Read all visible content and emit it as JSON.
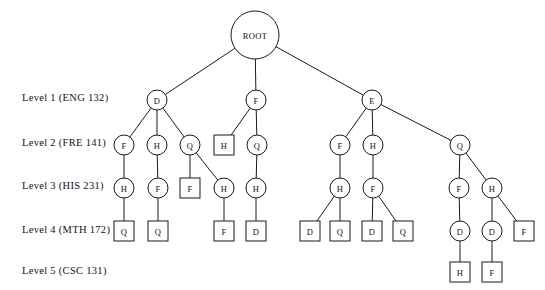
{
  "diagram": {
    "width": 545,
    "height": 290,
    "background": "#ffffff",
    "stroke_color": "#1a1a1a",
    "text_color": "#111111"
  },
  "level_labels": [
    {
      "id": "level-1",
      "text": "Level 1 (ENG 132)",
      "x": 22,
      "y": 92
    },
    {
      "id": "level-2",
      "text": "Level 2 (FRE 141)",
      "x": 22,
      "y": 137
    },
    {
      "id": "level-3",
      "text": "Level 3 (HIS 231)",
      "x": 22,
      "y": 180
    },
    {
      "id": "level-4",
      "text": "Level 4 (MTH 172)",
      "x": 22,
      "y": 224
    },
    {
      "id": "level-5",
      "text": "Level 5 (CSC 131)",
      "x": 22,
      "y": 265
    }
  ],
  "nodes": [
    {
      "id": "root",
      "label": "ROOT",
      "shape": "circle",
      "x": 255,
      "y": 35,
      "r": 24,
      "level": 0
    },
    {
      "id": "n_d1",
      "label": "D",
      "shape": "circle",
      "x": 157,
      "y": 100,
      "r": 10,
      "level": 1
    },
    {
      "id": "n_f1",
      "label": "F",
      "shape": "circle",
      "x": 256,
      "y": 100,
      "r": 10,
      "level": 1
    },
    {
      "id": "n_e1",
      "label": "E",
      "shape": "circle",
      "x": 372,
      "y": 100,
      "r": 10,
      "level": 1
    },
    {
      "id": "n_f2a",
      "label": "F",
      "shape": "circle",
      "x": 124,
      "y": 145,
      "r": 10,
      "level": 2
    },
    {
      "id": "n_h2a",
      "label": "H",
      "shape": "circle",
      "x": 157,
      "y": 145,
      "r": 10,
      "level": 2
    },
    {
      "id": "n_q2a",
      "label": "Q",
      "shape": "circle",
      "x": 190,
      "y": 145,
      "r": 10,
      "level": 2
    },
    {
      "id": "n_h2b",
      "label": "H",
      "shape": "square",
      "x": 224,
      "y": 145,
      "r": 10,
      "level": 2
    },
    {
      "id": "n_q2b",
      "label": "Q",
      "shape": "circle",
      "x": 257,
      "y": 145,
      "r": 10,
      "level": 2
    },
    {
      "id": "n_f2c",
      "label": "F",
      "shape": "circle",
      "x": 340,
      "y": 145,
      "r": 10,
      "level": 2
    },
    {
      "id": "n_h2c",
      "label": "H",
      "shape": "circle",
      "x": 373,
      "y": 145,
      "r": 10,
      "level": 2
    },
    {
      "id": "n_q2c",
      "label": "Q",
      "shape": "circle",
      "x": 460,
      "y": 145,
      "r": 10,
      "level": 2
    },
    {
      "id": "n_h3a",
      "label": "H",
      "shape": "circle",
      "x": 124,
      "y": 188,
      "r": 10,
      "level": 3
    },
    {
      "id": "n_f3a",
      "label": "F",
      "shape": "circle",
      "x": 158,
      "y": 188,
      "r": 10,
      "level": 3
    },
    {
      "id": "n_f3b",
      "label": "F",
      "shape": "square",
      "x": 190,
      "y": 188,
      "r": 10,
      "level": 3
    },
    {
      "id": "n_h3b",
      "label": "H",
      "shape": "circle",
      "x": 224,
      "y": 188,
      "r": 10,
      "level": 3
    },
    {
      "id": "n_h3c",
      "label": "H",
      "shape": "circle",
      "x": 256,
      "y": 188,
      "r": 10,
      "level": 3
    },
    {
      "id": "n_h3d",
      "label": "H",
      "shape": "circle",
      "x": 340,
      "y": 188,
      "r": 10,
      "level": 3
    },
    {
      "id": "n_f3c",
      "label": "F",
      "shape": "circle",
      "x": 373,
      "y": 188,
      "r": 10,
      "level": 3
    },
    {
      "id": "n_f3d",
      "label": "F",
      "shape": "circle",
      "x": 459,
      "y": 188,
      "r": 10,
      "level": 3
    },
    {
      "id": "n_h3e",
      "label": "H",
      "shape": "circle",
      "x": 492,
      "y": 188,
      "r": 10,
      "level": 3
    },
    {
      "id": "n_q4a",
      "label": "Q",
      "shape": "square",
      "x": 124,
      "y": 231,
      "r": 10,
      "level": 4
    },
    {
      "id": "n_q4b",
      "label": "Q",
      "shape": "square",
      "x": 158,
      "y": 231,
      "r": 10,
      "level": 4
    },
    {
      "id": "n_f4a",
      "label": "F",
      "shape": "square",
      "x": 224,
      "y": 231,
      "r": 10,
      "level": 4
    },
    {
      "id": "n_d4a",
      "label": "D",
      "shape": "square",
      "x": 256,
      "y": 231,
      "r": 10,
      "level": 4
    },
    {
      "id": "n_d4b",
      "label": "D",
      "shape": "square",
      "x": 310,
      "y": 231,
      "r": 10,
      "level": 4
    },
    {
      "id": "n_q4c",
      "label": "Q",
      "shape": "square",
      "x": 340,
      "y": 231,
      "r": 10,
      "level": 4
    },
    {
      "id": "n_d4c",
      "label": "D",
      "shape": "square",
      "x": 372,
      "y": 231,
      "r": 10,
      "level": 4
    },
    {
      "id": "n_q4d",
      "label": "Q",
      "shape": "square",
      "x": 403,
      "y": 231,
      "r": 10,
      "level": 4
    },
    {
      "id": "n_d4d",
      "label": "D",
      "shape": "circle",
      "x": 460,
      "y": 231,
      "r": 10,
      "level": 4
    },
    {
      "id": "n_d4e",
      "label": "D",
      "shape": "circle",
      "x": 492,
      "y": 231,
      "r": 10,
      "level": 4
    },
    {
      "id": "n_f4b",
      "label": "F",
      "shape": "square",
      "x": 524,
      "y": 231,
      "r": 10,
      "level": 4
    },
    {
      "id": "n_h5a",
      "label": "H",
      "shape": "square",
      "x": 460,
      "y": 272,
      "r": 10,
      "level": 5
    },
    {
      "id": "n_f5a",
      "label": "F",
      "shape": "square",
      "x": 492,
      "y": 272,
      "r": 10,
      "level": 5
    }
  ],
  "edges": [
    {
      "from": "root",
      "to": "n_d1"
    },
    {
      "from": "root",
      "to": "n_f1"
    },
    {
      "from": "root",
      "to": "n_e1"
    },
    {
      "from": "n_d1",
      "to": "n_f2a"
    },
    {
      "from": "n_d1",
      "to": "n_h2a"
    },
    {
      "from": "n_d1",
      "to": "n_q2a"
    },
    {
      "from": "n_f1",
      "to": "n_h2b"
    },
    {
      "from": "n_f1",
      "to": "n_q2b"
    },
    {
      "from": "n_e1",
      "to": "n_f2c"
    },
    {
      "from": "n_e1",
      "to": "n_h2c"
    },
    {
      "from": "n_e1",
      "to": "n_q2c"
    },
    {
      "from": "n_f2a",
      "to": "n_h3a"
    },
    {
      "from": "n_h2a",
      "to": "n_f3a"
    },
    {
      "from": "n_q2a",
      "to": "n_f3b"
    },
    {
      "from": "n_q2a",
      "to": "n_h3b"
    },
    {
      "from": "n_q2b",
      "to": "n_h3c"
    },
    {
      "from": "n_f2c",
      "to": "n_h3d"
    },
    {
      "from": "n_h2c",
      "to": "n_f3c"
    },
    {
      "from": "n_q2c",
      "to": "n_f3d"
    },
    {
      "from": "n_q2c",
      "to": "n_h3e"
    },
    {
      "from": "n_h3a",
      "to": "n_q4a"
    },
    {
      "from": "n_f3a",
      "to": "n_q4b"
    },
    {
      "from": "n_h3b",
      "to": "n_f4a"
    },
    {
      "from": "n_h3c",
      "to": "n_d4a"
    },
    {
      "from": "n_h3d",
      "to": "n_d4b"
    },
    {
      "from": "n_h3d",
      "to": "n_q4c"
    },
    {
      "from": "n_f3c",
      "to": "n_d4c"
    },
    {
      "from": "n_f3c",
      "to": "n_q4d"
    },
    {
      "from": "n_f3d",
      "to": "n_d4d"
    },
    {
      "from": "n_h3e",
      "to": "n_d4e"
    },
    {
      "from": "n_h3e",
      "to": "n_f4b"
    },
    {
      "from": "n_d4d",
      "to": "n_h5a"
    },
    {
      "from": "n_d4e",
      "to": "n_f5a"
    }
  ]
}
